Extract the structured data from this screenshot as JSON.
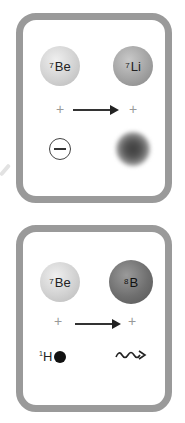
{
  "panels": [
    {
      "name": "electron-capture",
      "reactants": {
        "nucleus": {
          "mass": "7",
          "symbol": "Be"
        },
        "particle": "electron",
        "particle_symbol": "minus-circle"
      },
      "products": {
        "nucleus": {
          "mass": "7",
          "symbol": "Li"
        },
        "particle": "neutrino-cloud"
      },
      "operator_plus": "+"
    },
    {
      "name": "proton-capture",
      "reactants": {
        "nucleus": {
          "mass": "7",
          "symbol": "Be"
        },
        "particle": {
          "mass": "1",
          "symbol": "H"
        }
      },
      "products": {
        "nucleus": {
          "mass": "8",
          "symbol": "B"
        },
        "particle": "photon-gamma"
      },
      "operator_plus": "+"
    }
  ],
  "colors": {
    "frame": "#9a9a9a",
    "arrow": "#333333"
  }
}
